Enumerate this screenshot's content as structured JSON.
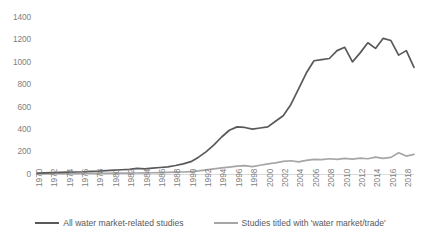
{
  "chart_data": {
    "type": "line",
    "title": "",
    "xlabel": "",
    "ylabel": "",
    "ylim": [
      0,
      1400
    ],
    "ytick_step": 200,
    "yticks": [
      0,
      200,
      400,
      600,
      800,
      1000,
      1200,
      1400
    ],
    "grid": false,
    "legend_position": "bottom",
    "x": [
      1970,
      1971,
      1972,
      1973,
      1974,
      1975,
      1976,
      1977,
      1978,
      1979,
      1980,
      1981,
      1982,
      1983,
      1984,
      1985,
      1986,
      1987,
      1988,
      1989,
      1990,
      1991,
      1992,
      1993,
      1994,
      1995,
      1996,
      1997,
      1998,
      1999,
      2000,
      2001,
      2002,
      2003,
      2004,
      2005,
      2006,
      2007,
      2008,
      2009,
      2010,
      2011,
      2012,
      2013,
      2014,
      2015,
      2016,
      2017,
      2018,
      2019
    ],
    "xtick_labels": [
      "1970",
      "1972",
      "1974",
      "1976",
      "1978",
      "1980",
      "1982",
      "1984",
      "1986",
      "1988",
      "1990",
      "1992",
      "1994",
      "1996",
      "1998",
      "2000",
      "2002",
      "2004",
      "2006",
      "2008",
      "2010",
      "2012",
      "2014",
      "2016",
      "2018"
    ],
    "series": [
      {
        "name": "All water market-related studies",
        "color": "#595959",
        "values": [
          8,
          10,
          12,
          14,
          16,
          18,
          20,
          24,
          26,
          30,
          34,
          38,
          42,
          50,
          46,
          52,
          58,
          64,
          76,
          90,
          110,
          150,
          200,
          260,
          330,
          390,
          420,
          415,
          400,
          410,
          420,
          470,
          520,
          620,
          760,
          900,
          1010,
          1020,
          1030,
          1100,
          1130,
          1000,
          1080,
          1170,
          1120,
          1210,
          1190,
          1060,
          1100,
          950
        ]
      },
      {
        "name": "Studies titled with 'water market/trade'",
        "color": "#a6a6a6",
        "values": [
          2,
          2,
          3,
          3,
          4,
          4,
          5,
          5,
          6,
          6,
          7,
          8,
          8,
          9,
          10,
          11,
          12,
          14,
          16,
          18,
          22,
          28,
          36,
          46,
          55,
          62,
          70,
          74,
          66,
          78,
          90,
          100,
          112,
          118,
          108,
          122,
          130,
          128,
          136,
          130,
          140,
          132,
          142,
          136,
          150,
          140,
          148,
          190,
          160,
          175
        ]
      }
    ]
  }
}
